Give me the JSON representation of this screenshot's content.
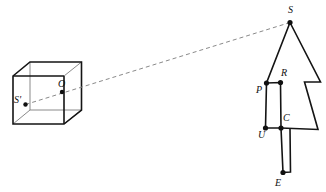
{
  "figure": {
    "background_color": "#ffffff",
    "line_color": "#141414",
    "dashed_line_color": "#8a8a8a",
    "thin_line_color": "#7d7d7d",
    "point_color": "#101010"
  },
  "labels": {
    "s": "S",
    "s_prime": "S'",
    "o": "O",
    "p": "P",
    "r": "R",
    "u": "U",
    "c": "C",
    "e": "E"
  },
  "label_positions": {
    "s": {
      "x": 288,
      "y": 13
    },
    "s_prime": {
      "x": 14,
      "y": 103
    },
    "o": {
      "x": 58,
      "y": 87
    },
    "p": {
      "x": 256,
      "y": 93
    },
    "r": {
      "x": 281,
      "y": 76
    },
    "u": {
      "x": 258,
      "y": 138
    },
    "c": {
      "x": 283,
      "y": 121
    },
    "e": {
      "x": 275,
      "y": 186
    }
  },
  "points": {
    "s": {
      "x": 290.0,
      "y": 22.5,
      "r": 2.6
    },
    "s_prime": {
      "x": 25.5,
      "y": 104.5,
      "r": 2.2
    },
    "o": {
      "x": 62.0,
      "y": 92.0,
      "r": 2.2
    },
    "p": {
      "x": 266.5,
      "y": 83.0,
      "r": 2.6
    },
    "r": {
      "x": 280.5,
      "y": 82.5,
      "r": 2.6
    },
    "u": {
      "x": 265.5,
      "y": 128.0,
      "r": 2.6
    },
    "c": {
      "x": 281.0,
      "y": 128.0,
      "r": 2.6
    },
    "e": {
      "x": 283.0,
      "y": 172.5,
      "r": 2.6
    }
  },
  "geometry": {
    "cube": {
      "front_face": [
        {
          "x": 13.0,
          "y": 76.0
        },
        {
          "x": 64.0,
          "y": 76.0
        },
        {
          "x": 64.0,
          "y": 124.0
        },
        {
          "x": 13.0,
          "y": 124.0
        }
      ],
      "back_face": [
        {
          "x": 30.0,
          "y": 62.0
        },
        {
          "x": 81.5,
          "y": 62.0
        },
        {
          "x": 81.5,
          "y": 110.0
        },
        {
          "x": 30.0,
          "y": 110.0
        }
      ],
      "connectors": [
        [
          {
            "x": 13.0,
            "y": 76.0
          },
          {
            "x": 30.0,
            "y": 62.0
          }
        ],
        [
          {
            "x": 64.0,
            "y": 76.0
          },
          {
            "x": 81.5,
            "y": 62.0
          }
        ],
        [
          {
            "x": 64.0,
            "y": 124.0
          },
          {
            "x": 81.5,
            "y": 110.0
          }
        ],
        [
          {
            "x": 13.0,
            "y": 124.0
          },
          {
            "x": 30.0,
            "y": 110.0
          }
        ]
      ],
      "visible_outline": [
        {
          "x": 13.0,
          "y": 76.0
        },
        {
          "x": 30.0,
          "y": 62.0
        },
        {
          "x": 81.5,
          "y": 62.0
        },
        {
          "x": 81.5,
          "y": 110.0
        },
        {
          "x": 64.0,
          "y": 124.0
        },
        {
          "x": 13.0,
          "y": 124.0
        }
      ],
      "hidden_edges": [
        [
          {
            "x": 30.0,
            "y": 110.0
          },
          {
            "x": 81.5,
            "y": 110.0
          }
        ],
        [
          {
            "x": 30.0,
            "y": 110.0
          },
          {
            "x": 30.0,
            "y": 62.0
          }
        ],
        [
          {
            "x": 30.0,
            "y": 110.0
          },
          {
            "x": 13.0,
            "y": 124.0
          }
        ]
      ],
      "interior_edges": [
        [
          {
            "x": 64.0,
            "y": 76.0
          },
          {
            "x": 64.0,
            "y": 124.0
          }
        ],
        [
          {
            "x": 13.0,
            "y": 76.0
          },
          {
            "x": 64.0,
            "y": 76.0
          }
        ]
      ]
    },
    "arrow_body_outline": [
      {
        "x": 290.0,
        "y": 22.5
      },
      {
        "x": 320.5,
        "y": 82.0
      },
      {
        "x": 304.5,
        "y": 82.0
      },
      {
        "x": 318.0,
        "y": 129.5
      },
      {
        "x": 281.0,
        "y": 128.0
      },
      {
        "x": 265.5,
        "y": 128.0
      },
      {
        "x": 266.5,
        "y": 83.0
      },
      {
        "x": 290.0,
        "y": 22.5
      }
    ],
    "notch_left": [
      {
        "x": 266.5,
        "y": 83.0
      },
      {
        "x": 280.5,
        "y": 82.5
      },
      {
        "x": 281.0,
        "y": 128.0
      }
    ],
    "stem": [
      {
        "x": 281.0,
        "y": 128.0
      },
      {
        "x": 283.0,
        "y": 172.5
      },
      {
        "x": 290.5,
        "y": 172.0
      },
      {
        "x": 290.0,
        "y": 129.0
      }
    ],
    "ray_dashed": [
      {
        "x": 25.5,
        "y": 104.5
      },
      {
        "x": 290.0,
        "y": 22.5
      }
    ],
    "ray_dashed_inside_cube": [
      {
        "x": 25.5,
        "y": 104.5
      },
      {
        "x": 62.0,
        "y": 92.0
      }
    ]
  }
}
